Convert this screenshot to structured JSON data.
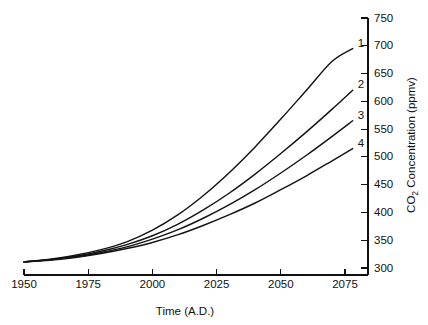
{
  "chart_data": {
    "type": "line",
    "title": "",
    "subtitle": "",
    "xlabel": "Time (A.D.)",
    "ylabel": "CO2 Concentration (ppmv)",
    "ylabel_parts": {
      "prefix": "CO",
      "subscript": "2",
      "suffix": " Concentration (ppmv)"
    },
    "xlim": [
      1950,
      2080
    ],
    "ylim": [
      300,
      750
    ],
    "grid": false,
    "legend_position": "curve-end-labels",
    "y_axis_position": "right",
    "xticks": [
      1950,
      1975,
      2000,
      2025,
      2050,
      2075
    ],
    "xticklabels": [
      "1950",
      "1975",
      "2000",
      "2025",
      "2050",
      "2075"
    ],
    "yticks": [
      300,
      350,
      400,
      450,
      500,
      550,
      600,
      650,
      700,
      750
    ],
    "yticklabels": [
      "300",
      "350",
      "400",
      "450",
      "500",
      "550",
      "600",
      "650",
      "700",
      "750"
    ],
    "x": [
      1950,
      1960,
      1970,
      1980,
      1990,
      2000,
      2010,
      2020,
      2030,
      2040,
      2050,
      2060,
      2070,
      2078
    ],
    "series": [
      {
        "name": "1",
        "label": "1",
        "color": "#141414",
        "values": [
          311,
          316,
          323,
          333,
          347,
          368,
          396,
          431,
          472,
          518,
          568,
          620,
          672,
          695
        ]
      },
      {
        "name": "2",
        "label": "2",
        "color": "#141414",
        "values": [
          311,
          315,
          321,
          330,
          342,
          358,
          379,
          405,
          435,
          469,
          506,
          545,
          586,
          620
        ]
      },
      {
        "name": "3",
        "label": "3",
        "color": "#141414",
        "values": [
          311,
          315,
          320,
          328,
          338,
          352,
          369,
          390,
          414,
          441,
          471,
          503,
          537,
          565
        ]
      },
      {
        "name": "4",
        "label": "4",
        "color": "#141414",
        "values": [
          311,
          314,
          319,
          326,
          335,
          346,
          360,
          377,
          396,
          417,
          441,
          466,
          493,
          515
        ]
      }
    ]
  }
}
